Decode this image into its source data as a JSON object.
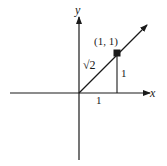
{
  "diagram": {
    "axes": {
      "x_label": "x",
      "y_label": "y"
    },
    "point": {
      "label": "(1, 1)"
    },
    "hypotenuse_label": "√2",
    "vertical_leg_label": "1",
    "horizontal_leg_label": "1",
    "colors": {
      "ink": "#1a1a1a",
      "background": "#ffffff"
    }
  }
}
